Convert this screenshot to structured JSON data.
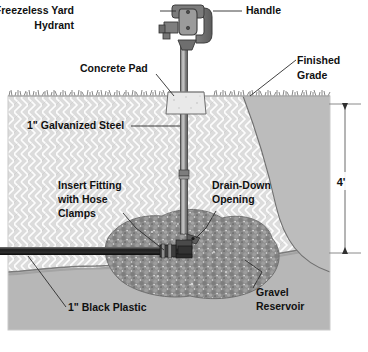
{
  "diagram": {
    "colors": {
      "page_background": "#ffffff",
      "soil_upper": "#dcdcdc",
      "soil_hatch": "#ffffff",
      "soil_lower": "#b5b5b5",
      "cutaway_right": "#b8b8b8",
      "gravel": "#8c8c8c",
      "gravel_speck": "#d8d8d8",
      "steel_pipe": "#8a8a8a",
      "pipe_outline": "#3a3a3a",
      "hydrant_head": "#6e6e6e",
      "black_plastic": "#2e2e2e",
      "concrete_pad": "#e6e6e6",
      "grass_line": "#555555",
      "label_text": "#111111",
      "leader_line": "#2b2b2b"
    },
    "labels": [
      {
        "id": "freezeless-yard-hydrant",
        "lines": [
          "Freezeless Yard",
          "Hydrant"
        ],
        "x": 74,
        "y": 14
      },
      {
        "id": "handle",
        "lines": [
          "Handle"
        ],
        "x": 246,
        "y": 14
      },
      {
        "id": "concrete-pad",
        "lines": [
          "Concrete Pad"
        ],
        "x": 80,
        "y": 72
      },
      {
        "id": "finished-grade",
        "lines": [
          "Finished",
          "Grade"
        ],
        "x": 297,
        "y": 64
      },
      {
        "id": "galvanized-steel",
        "lines": [
          "1\" Galvanized Steel"
        ],
        "x": 27,
        "y": 129
      },
      {
        "id": "insert-fitting-hose-clamps",
        "lines": [
          "Insert Fitting",
          "with Hose",
          "Clamps"
        ],
        "x": 58,
        "y": 189
      },
      {
        "id": "drain-down-opening",
        "lines": [
          "Drain-Down",
          "Opening"
        ],
        "x": 212,
        "y": 189
      },
      {
        "id": "black-plastic",
        "lines": [
          "1\" Black Plastic"
        ],
        "x": 68,
        "y": 311
      },
      {
        "id": "gravel-reservoir",
        "lines": [
          "Gravel",
          "Reservoir"
        ],
        "x": 256,
        "y": 296
      }
    ],
    "dimension": {
      "id": "depth-dimension",
      "value": "4'",
      "label_x": 341,
      "label_y": 186,
      "top_y": 104,
      "bottom_y": 253,
      "line_x": 345
    }
  }
}
